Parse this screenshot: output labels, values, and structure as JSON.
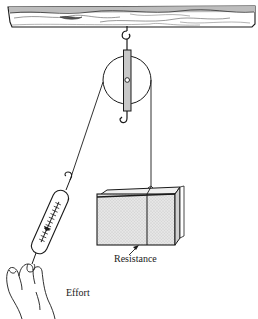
{
  "figure": {
    "labels": {
      "effort": "Effort",
      "resistance": "Resistance"
    },
    "parts": [
      "ceiling-beam",
      "ceiling-hook",
      "pulley-wheel",
      "pulley-frame",
      "pulley-lower-hook",
      "rope",
      "spring-scale",
      "hand",
      "block"
    ],
    "colors": {
      "line": "#1a1a1a",
      "beam_grain": "#9a9a9a",
      "block_fill": "#d9d9d9",
      "frame_fill": "#c8c8c8",
      "background": "#ffffff"
    }
  }
}
